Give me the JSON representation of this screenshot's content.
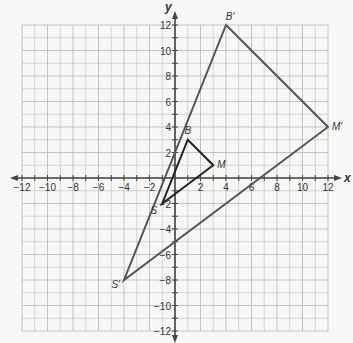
{
  "diagram": {
    "type": "coordinate-plane-dilation",
    "axes": {
      "x_label": "x",
      "y_label": "y",
      "x_range": [
        -12,
        12
      ],
      "y_range": [
        -12,
        12
      ],
      "x_ticks": [
        "-12",
        "-10",
        "-8",
        "-6",
        "-4",
        "-2",
        "2",
        "4",
        "6",
        "8",
        "10",
        "12"
      ],
      "y_ticks": [
        "12",
        "10",
        "8",
        "6",
        "4",
        "2",
        "-2",
        "-4",
        "-6",
        "-8",
        "-10",
        "-12"
      ],
      "grid": true,
      "grid_step": 1
    },
    "original_triangle": {
      "name": "BMS",
      "vertices": [
        {
          "label": "B",
          "x": 1,
          "y": 3
        },
        {
          "label": "M",
          "x": 3,
          "y": 1
        },
        {
          "label": "S",
          "x": -1,
          "y": -2
        }
      ],
      "color": "#222222"
    },
    "image_triangle": {
      "name": "B'M'S'",
      "vertices": [
        {
          "label": "B′",
          "x": 4,
          "y": 12
        },
        {
          "label": "M′",
          "x": 12,
          "y": 4
        },
        {
          "label": "S′",
          "x": -4,
          "y": -8
        }
      ],
      "color": "#555555"
    },
    "colors": {
      "grid": "#bdbdbd",
      "axis": "#444444",
      "background": "#f7f7f5"
    }
  }
}
